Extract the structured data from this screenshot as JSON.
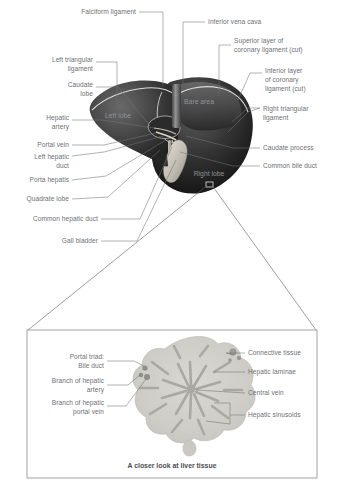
{
  "figure": {
    "background_color": "#ffffff",
    "label_color": "#6e7175",
    "organ_label_color": "#8e9195",
    "leader_color": "#6e7175"
  },
  "main_diagram": {
    "name": "liver-anterior-view",
    "organ_labels": [
      {
        "id": "left-lobe",
        "text": "Left lobe",
        "x": 118,
        "y": 118
      },
      {
        "id": "bare-area",
        "text": "Bare area",
        "x": 199,
        "y": 104
      },
      {
        "id": "right-lobe",
        "text": "Right lobe",
        "x": 209,
        "y": 176
      }
    ],
    "callouts_left": [
      {
        "id": "falciform-ligament",
        "text": "Falciform ligament",
        "lines": [
          "Falciform ligament"
        ],
        "text_x": 136,
        "text_y": 14
      },
      {
        "id": "left-triangular-ligament",
        "text": "Left triangular ligament",
        "lines": [
          "Left triangular",
          "ligament"
        ],
        "text_x": 93,
        "text_y": 64
      },
      {
        "id": "caudate-lobe",
        "text": "Caudate lobe",
        "lines": [
          "Caudate",
          "lobe"
        ],
        "text_x": 93,
        "text_y": 89
      },
      {
        "id": "hepatic-artery",
        "text": "Hepatic artery",
        "lines": [
          "Hepatic",
          "artery"
        ],
        "text_x": 69,
        "text_y": 122
      },
      {
        "id": "portal-vein",
        "text": "Portal vein",
        "lines": [
          "Portal vein"
        ],
        "text_x": 69,
        "text_y": 147
      },
      {
        "id": "left-hepatic-duct",
        "text": "Left hepatic duct",
        "lines": [
          "Left hepatic",
          "duct"
        ],
        "text_x": 69,
        "text_y": 159
      },
      {
        "id": "porta-hepatis",
        "text": "Porta hepatis",
        "lines": [
          "Porta hepatis"
        ],
        "text_x": 69,
        "text_y": 182
      },
      {
        "id": "quadrate-lobe",
        "text": "Quadrate lobe",
        "lines": [
          "Quadrate lobe"
        ],
        "text_x": 69,
        "text_y": 201
      },
      {
        "id": "common-hepatic-duct",
        "text": "Common hepatic duct",
        "lines": [
          "Common hepatic duct"
        ],
        "text_x": 98,
        "text_y": 221
      },
      {
        "id": "gall-bladder",
        "text": "Gall bladder",
        "lines": [
          "Gall bladder"
        ],
        "text_x": 98,
        "text_y": 243
      }
    ],
    "callouts_right": [
      {
        "id": "inferior-vena-cava",
        "text": "Inferior vena cava",
        "lines": [
          "Inferior vena cava"
        ],
        "text_x": 208,
        "text_y": 24
      },
      {
        "id": "superior-coronary-ligament",
        "text": "Superior layer of coronary ligament (cut)",
        "lines": [
          "Superior layer of",
          "coronary ligament (cut)"
        ],
        "text_x": 234,
        "text_y": 43
      },
      {
        "id": "inferior-coronary-ligament",
        "text": "Inferior layer of coronary ligament (cut)",
        "lines": [
          "Inferior layer",
          "of coronary",
          "ligament (cut)"
        ],
        "text_x": 265,
        "text_y": 73
      },
      {
        "id": "right-triangular-ligament",
        "text": "Right triangular ligament",
        "lines": [
          "Right triangular",
          "ligament"
        ],
        "text_x": 263,
        "text_y": 111
      },
      {
        "id": "caudate-process",
        "text": "Caudate process",
        "lines": [
          "Caudate process"
        ],
        "text_x": 263,
        "text_y": 150
      },
      {
        "id": "common-bile-duct",
        "text": "Common bile duct",
        "lines": [
          "Common bile duct"
        ],
        "text_x": 263,
        "text_y": 168
      }
    ]
  },
  "inset": {
    "name": "liver-lobule-histology",
    "caption": "A closer look at liver tissue",
    "callouts_left": [
      {
        "id": "portal-triad-bile-duct",
        "lines": [
          "Portal triad:",
          "Bile duct"
        ],
        "text_x": 104,
        "text_y": 363
      },
      {
        "id": "branch-hepatic-artery",
        "lines": [
          "Branch of hepatic",
          "artery"
        ],
        "text_x": 104,
        "text_y": 385
      },
      {
        "id": "branch-hepatic-portal-vein",
        "lines": [
          "Branch of hepatic",
          "portal vein"
        ],
        "text_x": 104,
        "text_y": 408
      }
    ],
    "callouts_right": [
      {
        "id": "connective-tissue",
        "lines": [
          "Connective tissue"
        ],
        "text_x": 248,
        "text_y": 355
      },
      {
        "id": "hepatic-laminae",
        "lines": [
          "Hepatic laminae"
        ],
        "text_x": 248,
        "text_y": 374
      },
      {
        "id": "central-vein",
        "lines": [
          "Central vein"
        ],
        "text_x": 248,
        "text_y": 395
      },
      {
        "id": "hepatic-sinusoids",
        "lines": [
          "Hepatic sinusoids"
        ],
        "text_x": 248,
        "text_y": 417
      }
    ]
  }
}
